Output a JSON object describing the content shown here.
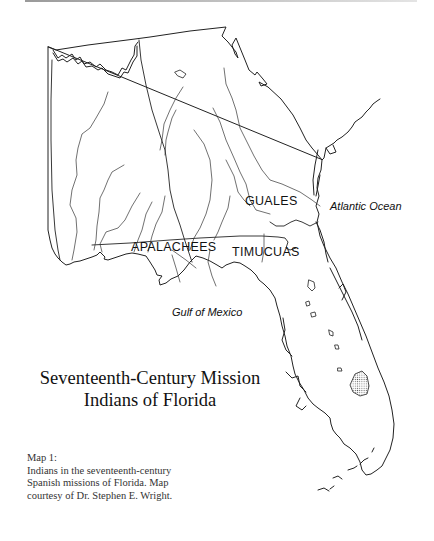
{
  "map": {
    "title_lines": [
      "Seventeenth-Century Mission",
      "Indians of Florida"
    ],
    "tribe_labels": {
      "guales": "GUALES",
      "apalachees": "APALACHEES",
      "timucuas": "TIMUCUAS"
    },
    "water_labels": {
      "atlantic": "Atlantic Ocean",
      "gulf": "Gulf of Mexico"
    },
    "caption": {
      "heading": "Map 1:",
      "lines": [
        "Indians in the seventeenth-century",
        "Spanish missions of Florida. Map",
        "courtesy of Dr. Stephen E. Wright."
      ]
    }
  }
}
